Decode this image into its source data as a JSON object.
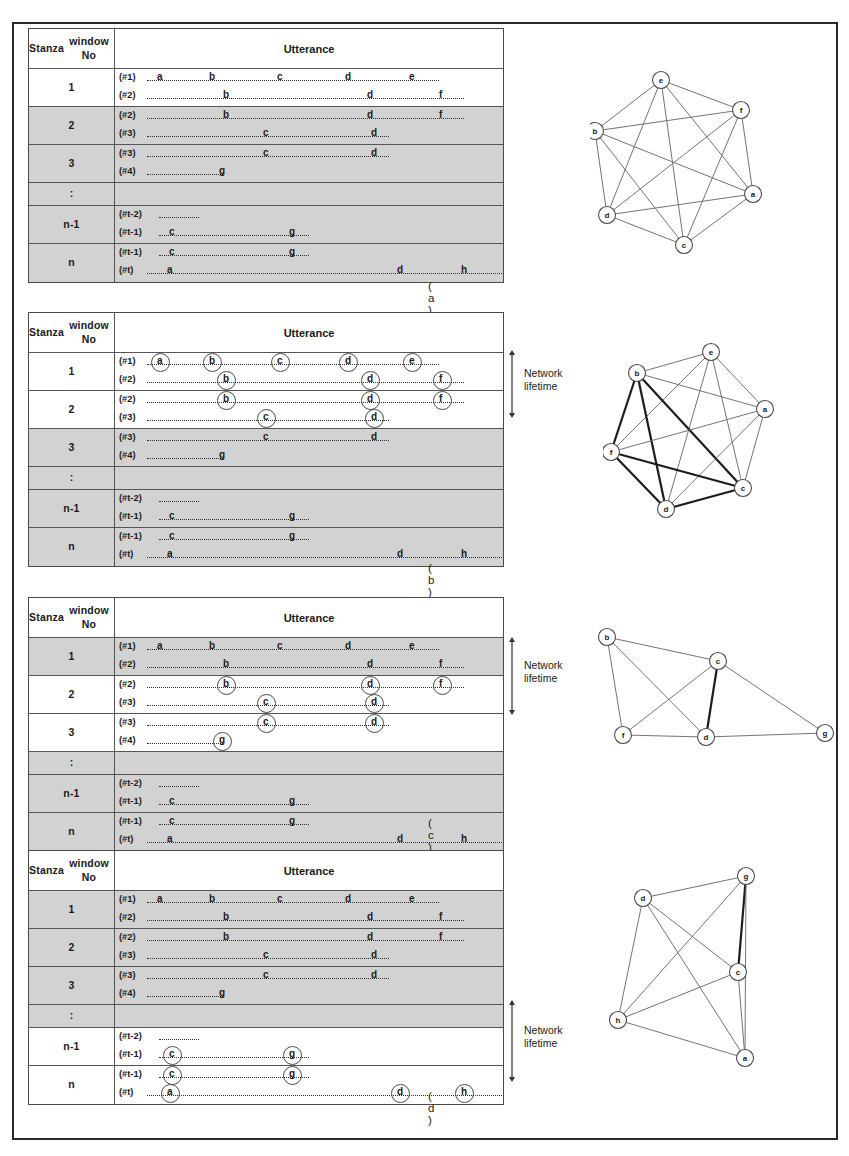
{
  "table": {
    "header": {
      "col1": "Stanza\nwindow No",
      "col1_line1": "Stanza",
      "col1_line2": "window No",
      "col2": "Utterance"
    },
    "row_labels": [
      "1",
      "2",
      "3",
      ":",
      "n-1",
      "n"
    ],
    "line_tags": {
      "t1": "(#1)",
      "t2": "(#2)",
      "t3": "(#3)",
      "t4": "(#4)",
      "tm2": "(#t-2)",
      "tm1": "(#t-1)",
      "tt": "(#t)"
    },
    "tokens": {
      "a": "a",
      "b": "b",
      "c": "c",
      "d": "d",
      "e": "e",
      "f": "f",
      "g": "g",
      "h": "h"
    }
  },
  "lifetime": {
    "label_line1": "Network",
    "label_line2": "lifetime"
  },
  "captions": {
    "a": "( a )",
    "b": "( b )",
    "c": "( c )",
    "d": "( d )"
  },
  "panels": [
    {
      "id": "a",
      "caption": "( a )",
      "shaded_rows": [
        false,
        true,
        true,
        true,
        true,
        true
      ],
      "circled_rows": [],
      "lifetime_visible": false,
      "graph": {
        "nodes": [
          {
            "id": "e",
            "label": "e",
            "x": 71,
            "y": 24
          },
          {
            "id": "f",
            "label": "f",
            "x": 151,
            "y": 54
          },
          {
            "id": "a",
            "label": "a",
            "x": 163,
            "y": 138
          },
          {
            "id": "c",
            "label": "c",
            "x": 94,
            "y": 189
          },
          {
            "id": "d",
            "label": "d",
            "x": 17,
            "y": 159
          },
          {
            "id": "b",
            "label": "b",
            "x": 5,
            "y": 75
          }
        ],
        "edges": [
          {
            "from": "e",
            "to": "f",
            "bold": false
          },
          {
            "from": "e",
            "to": "a",
            "bold": false
          },
          {
            "from": "e",
            "to": "c",
            "bold": false
          },
          {
            "from": "e",
            "to": "d",
            "bold": false
          },
          {
            "from": "e",
            "to": "b",
            "bold": false
          },
          {
            "from": "f",
            "to": "a",
            "bold": false
          },
          {
            "from": "f",
            "to": "c",
            "bold": false
          },
          {
            "from": "f",
            "to": "d",
            "bold": false
          },
          {
            "from": "f",
            "to": "b",
            "bold": false
          },
          {
            "from": "a",
            "to": "c",
            "bold": false
          },
          {
            "from": "a",
            "to": "d",
            "bold": false
          },
          {
            "from": "a",
            "to": "b",
            "bold": false
          },
          {
            "from": "c",
            "to": "d",
            "bold": false
          },
          {
            "from": "c",
            "to": "b",
            "bold": false
          },
          {
            "from": "d",
            "to": "b",
            "bold": false
          }
        ]
      }
    },
    {
      "id": "b",
      "caption": "( b )",
      "shaded_rows": [
        false,
        false,
        true,
        true,
        true,
        true
      ],
      "circled_rows": [
        0,
        1
      ],
      "lifetime_visible": true,
      "graph": {
        "nodes": [
          {
            "id": "e",
            "label": "e",
            "x": 108,
            "y": 10
          },
          {
            "id": "b",
            "label": "b",
            "x": 34,
            "y": 31
          },
          {
            "id": "a",
            "label": "a",
            "x": 162,
            "y": 67
          },
          {
            "id": "f",
            "label": "f",
            "x": 8,
            "y": 110
          },
          {
            "id": "c",
            "label": "c",
            "x": 140,
            "y": 146
          },
          {
            "id": "d",
            "label": "d",
            "x": 63,
            "y": 167
          }
        ],
        "edges": [
          {
            "from": "e",
            "to": "b",
            "bold": false
          },
          {
            "from": "e",
            "to": "a",
            "bold": false
          },
          {
            "from": "e",
            "to": "f",
            "bold": false
          },
          {
            "from": "e",
            "to": "c",
            "bold": false
          },
          {
            "from": "e",
            "to": "d",
            "bold": false
          },
          {
            "from": "b",
            "to": "a",
            "bold": false
          },
          {
            "from": "b",
            "to": "f",
            "bold": true
          },
          {
            "from": "b",
            "to": "c",
            "bold": true
          },
          {
            "from": "b",
            "to": "d",
            "bold": true
          },
          {
            "from": "a",
            "to": "f",
            "bold": false
          },
          {
            "from": "a",
            "to": "c",
            "bold": false
          },
          {
            "from": "a",
            "to": "d",
            "bold": false
          },
          {
            "from": "f",
            "to": "c",
            "bold": true
          },
          {
            "from": "f",
            "to": "d",
            "bold": true
          },
          {
            "from": "c",
            "to": "d",
            "bold": true
          }
        ]
      }
    },
    {
      "id": "c",
      "caption": "( c )",
      "shaded_rows": [
        true,
        false,
        false,
        true,
        true,
        true
      ],
      "circled_rows": [
        1,
        2
      ],
      "lifetime_visible": true,
      "graph": {
        "nodes": [
          {
            "id": "b",
            "label": "b",
            "x": 14,
            "y": 22
          },
          {
            "id": "c",
            "label": "c",
            "x": 125,
            "y": 46
          },
          {
            "id": "f",
            "label": "f",
            "x": 30,
            "y": 120
          },
          {
            "id": "d",
            "label": "d",
            "x": 113,
            "y": 122
          },
          {
            "id": "g",
            "label": "g",
            "x": 232,
            "y": 118
          }
        ],
        "edges": [
          {
            "from": "b",
            "to": "c",
            "bold": false
          },
          {
            "from": "b",
            "to": "f",
            "bold": false
          },
          {
            "from": "b",
            "to": "d",
            "bold": false
          },
          {
            "from": "c",
            "to": "f",
            "bold": false
          },
          {
            "from": "c",
            "to": "d",
            "bold": true
          },
          {
            "from": "c",
            "to": "g",
            "bold": false
          },
          {
            "from": "f",
            "to": "d",
            "bold": false
          },
          {
            "from": "d",
            "to": "g",
            "bold": false
          }
        ]
      }
    },
    {
      "id": "d",
      "caption": "( d )",
      "shaded_rows": [
        true,
        true,
        true,
        true,
        false,
        false
      ],
      "circled_rows": [
        4,
        5
      ],
      "lifetime_visible": true,
      "graph": {
        "nodes": [
          {
            "id": "g",
            "label": "g",
            "x": 148,
            "y": 16
          },
          {
            "id": "d",
            "label": "d",
            "x": 45,
            "y": 38
          },
          {
            "id": "c",
            "label": "c",
            "x": 140,
            "y": 112
          },
          {
            "id": "h",
            "label": "h",
            "x": 20,
            "y": 160
          },
          {
            "id": "a",
            "label": "a",
            "x": 147,
            "y": 198
          }
        ],
        "edges": [
          {
            "from": "g",
            "to": "d",
            "bold": false
          },
          {
            "from": "g",
            "to": "c",
            "bold": true
          },
          {
            "from": "g",
            "to": "h",
            "bold": false
          },
          {
            "from": "g",
            "to": "a",
            "bold": false
          },
          {
            "from": "d",
            "to": "c",
            "bold": false
          },
          {
            "from": "d",
            "to": "h",
            "bold": false
          },
          {
            "from": "d",
            "to": "a",
            "bold": false
          },
          {
            "from": "c",
            "to": "h",
            "bold": false
          },
          {
            "from": "c",
            "to": "a",
            "bold": false
          },
          {
            "from": "h",
            "to": "a",
            "bold": false
          }
        ]
      }
    }
  ],
  "utterance_lines": {
    "l1": {
      "tag": "(#1)",
      "dots_start": 28,
      "dots_end": 320,
      "tokens": [
        {
          "t": "a",
          "x": 38
        },
        {
          "t": "b",
          "x": 90
        },
        {
          "t": "c",
          "x": 158
        },
        {
          "t": "d",
          "x": 226
        },
        {
          "t": "e",
          "x": 290
        }
      ]
    },
    "l2": {
      "tag": "(#2)",
      "dots_start": 28,
      "dots_end": 345,
      "tokens": [
        {
          "t": "b",
          "x": 104
        },
        {
          "t": "d",
          "x": 248
        },
        {
          "t": "f",
          "x": 320
        }
      ]
    },
    "l3": {
      "tag": "(#3)",
      "dots_start": 28,
      "dots_end": 270,
      "tokens": [
        {
          "t": "c",
          "x": 144
        },
        {
          "t": "d",
          "x": 252
        }
      ]
    },
    "l4": {
      "tag": "(#4)",
      "dots_start": 28,
      "dots_end": 104,
      "tokens": [
        {
          "t": "g",
          "x": 100
        }
      ]
    },
    "l5": {
      "tag": "(#t-2)",
      "dots_start": 40,
      "dots_end": 80,
      "tokens": []
    },
    "l6": {
      "tag": "(#t-1)",
      "dots_start": 40,
      "dots_end": 190,
      "tokens": [
        {
          "t": "c",
          "x": 50
        },
        {
          "t": "g",
          "x": 170
        }
      ]
    },
    "l7": {
      "tag": "(#t)",
      "dots_start": 28,
      "dots_end": 385,
      "tokens": [
        {
          "t": "a",
          "x": 48
        },
        {
          "t": "d",
          "x": 278
        },
        {
          "t": "h",
          "x": 342
        }
      ]
    }
  }
}
